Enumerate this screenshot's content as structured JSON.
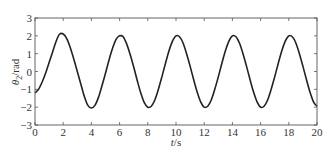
{
  "chart_data": {
    "type": "line",
    "title": "",
    "xlabel": "t/s",
    "ylabel": "θ2/rad",
    "xlim": [
      0,
      20
    ],
    "ylim": [
      -3,
      3
    ],
    "xticks": [
      0,
      2,
      4,
      6,
      8,
      10,
      12,
      14,
      16,
      18,
      20
    ],
    "yticks": [
      -3,
      -2,
      -1,
      0,
      1,
      2,
      3
    ],
    "grid": false,
    "legend": null,
    "series": [
      {
        "name": "theta2",
        "color": "#222222",
        "x": [
          0,
          0.25,
          0.5,
          0.75,
          1.0,
          1.25,
          1.5,
          1.75,
          2.0,
          2.25,
          2.5,
          2.75,
          3.0,
          3.25,
          3.5,
          3.75,
          4.0,
          4.25,
          4.5,
          4.75,
          5.0,
          5.25,
          5.5,
          5.75,
          6.0,
          6.25,
          6.5,
          6.75,
          7.0,
          7.25,
          7.5,
          7.75,
          8.0,
          8.25,
          8.5,
          8.75,
          9.0,
          9.25,
          9.5,
          9.75,
          10.0,
          10.25,
          10.5,
          10.75,
          11.0,
          11.25,
          11.5,
          11.75,
          12.0,
          12.25,
          12.5,
          12.75,
          13.0,
          13.25,
          13.5,
          13.75,
          14.0,
          14.25,
          14.5,
          14.75,
          15.0,
          15.25,
          15.5,
          15.75,
          16.0,
          16.25,
          16.5,
          16.75,
          17.0,
          17.25,
          17.5,
          17.75,
          18.0,
          18.25,
          18.5,
          18.75,
          19.0,
          19.25,
          19.5,
          19.75,
          20.0
        ],
        "y": [
          -1.2,
          -1.0,
          -0.6,
          -0.1,
          0.5,
          1.1,
          1.7,
          2.1,
          2.1,
          1.85,
          1.35,
          0.7,
          0.0,
          -0.7,
          -1.4,
          -1.9,
          -2.05,
          -1.9,
          -1.45,
          -0.8,
          -0.1,
          0.65,
          1.3,
          1.8,
          2.0,
          1.95,
          1.55,
          0.95,
          0.25,
          -0.5,
          -1.2,
          -1.75,
          -2.0,
          -1.95,
          -1.6,
          -1.0,
          -0.3,
          0.45,
          1.15,
          1.7,
          2.0,
          1.95,
          1.6,
          1.0,
          0.3,
          -0.45,
          -1.15,
          -1.7,
          -2.0,
          -1.95,
          -1.6,
          -1.0,
          -0.3,
          0.45,
          1.15,
          1.7,
          2.0,
          1.95,
          1.6,
          1.0,
          0.3,
          -0.45,
          -1.15,
          -1.7,
          -2.0,
          -1.95,
          -1.6,
          -1.0,
          -0.3,
          0.45,
          1.15,
          1.7,
          2.0,
          1.95,
          1.6,
          1.0,
          0.3,
          -0.45,
          -1.15,
          -1.7,
          -1.95
        ]
      }
    ]
  },
  "axes": {
    "xlabel_italic": "t",
    "xlabel_unit": "/s",
    "ylabel_symbol": "θ",
    "ylabel_sub": "2",
    "ylabel_unit": "/rad"
  }
}
